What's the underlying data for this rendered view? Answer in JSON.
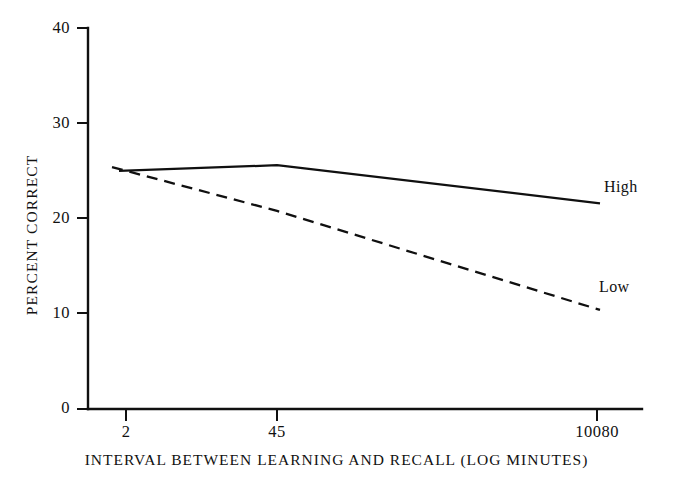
{
  "figure": {
    "background_color": "#ffffff",
    "ink_color": "#101010"
  },
  "axes": {
    "y_label": "PERCENT CORRECT",
    "x_label": "INTERVAL BETWEEN LEARNING AND RECALL (LOG MINUTES)",
    "y_ticks": [
      "0",
      "10",
      "20",
      "30",
      "40"
    ],
    "x_ticks": [
      "2",
      "45",
      "10080"
    ]
  },
  "series_labels": {
    "high": "High",
    "low": "Low"
  },
  "chart_data": {
    "type": "line",
    "title": "",
    "subtitle": "",
    "xlabel": "INTERVAL BETWEEN LEARNING AND RECALL (LOG MINUTES)",
    "ylabel": "PERCENT CORRECT",
    "x": [
      2,
      45,
      10080
    ],
    "x_tick_labels": [
      "2",
      "45",
      "10080"
    ],
    "x_scale": "log",
    "y_ticks": [
      0,
      10,
      20,
      30,
      40
    ],
    "ylim": [
      0,
      40
    ],
    "grid": false,
    "legend_position": "inline-right-end-of-line",
    "series": [
      {
        "name": "High",
        "style": "solid",
        "color": "#101010",
        "values": [
          25.0,
          25.6,
          21.6
        ]
      },
      {
        "name": "Low",
        "style": "dashed",
        "color": "#101010",
        "values": [
          25.4,
          20.8,
          10.4
        ]
      }
    ],
    "annotations": [
      {
        "text": "High",
        "series": "High",
        "placement": "right of final point"
      },
      {
        "text": "Low",
        "series": "Low",
        "placement": "right of final point"
      }
    ]
  }
}
